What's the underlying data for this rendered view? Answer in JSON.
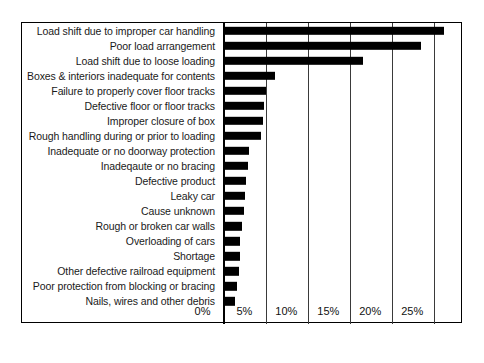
{
  "chart_data": {
    "type": "bar",
    "orientation": "horizontal",
    "title": "",
    "subtitle": "",
    "xlabel": "",
    "ylabel": "",
    "xlim": [
      0,
      28.2
    ],
    "grid": true,
    "legend": null,
    "legend_position": "none",
    "bar_color": "#000000",
    "xticks": [
      "0%",
      "5%",
      "10%",
      "15%",
      "20%",
      "25%"
    ],
    "xtick_values": [
      0,
      5,
      10,
      15,
      20,
      25
    ],
    "categories": [
      "Load shift due to improper car handling",
      "Poor load arrangement",
      "Load shift due to loose loading",
      "Boxes & interiors inadequate for contents",
      "Failure to properly cover floor tracks",
      "Defective floor or floor tracks",
      "Improper closure of box",
      "Rough handling during or prior to loading",
      "Inadequate or no doorway protection",
      "Inadeqaute or no bracing",
      "Defective product",
      "Leaky car",
      "Cause unknown",
      "Rough or broken car walls",
      "Overloading of cars",
      "Shortage",
      "Other defective railroad equipment",
      "Poor protection from blocking or bracing",
      "Nails, wires and other debris"
    ],
    "values": [
      26.2,
      23.4,
      16.5,
      6.0,
      5.0,
      4.7,
      4.6,
      4.3,
      2.9,
      2.8,
      2.6,
      2.4,
      2.3,
      2.1,
      1.9,
      1.8,
      1.7,
      1.5,
      1.3
    ]
  }
}
